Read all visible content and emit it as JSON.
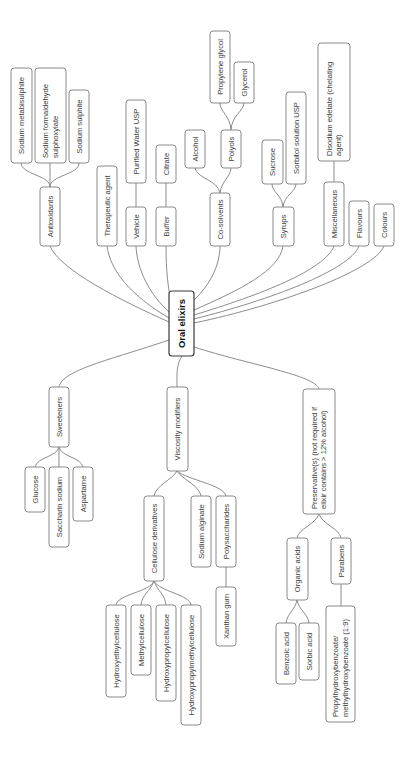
{
  "diagram": {
    "title": "Oral elixirs",
    "colors": {
      "edge": "#8c8c8c",
      "box_border": "#8a8a8a",
      "root_border": "#3a3a3a",
      "text": "#3c3c3c",
      "background": "#ffffff"
    },
    "nodes": [
      {
        "id": "root",
        "label": [
          "Oral elixirs"
        ],
        "x": 169,
        "y": 291,
        "w": 25,
        "h": 65,
        "root": true
      },
      {
        "id": "antioxidants",
        "label": [
          "Antioxidants"
        ],
        "x": 40,
        "y": 187,
        "w": 20,
        "h": 59
      },
      {
        "id": "sodium-metabisulphite",
        "label": [
          "Sodium metabisulphite"
        ],
        "x": 11,
        "y": 68,
        "w": 21,
        "h": 95
      },
      {
        "id": "sodium-formaldehyde",
        "label": [
          "Sodium formaldehyde",
          "sulphoxylate"
        ],
        "x": 35,
        "y": 68,
        "w": 31,
        "h": 95
      },
      {
        "id": "sodium-sulphite",
        "label": [
          "Sodium sulphite"
        ],
        "x": 69,
        "y": 90,
        "w": 20,
        "h": 73
      },
      {
        "id": "therapeutic-agent",
        "label": [
          "Therapeutic agent"
        ],
        "x": 97,
        "y": 166,
        "w": 20,
        "h": 80
      },
      {
        "id": "vehicle",
        "label": [
          "Vehicle"
        ],
        "x": 126,
        "y": 207,
        "w": 20,
        "h": 39
      },
      {
        "id": "purified-water",
        "label": [
          "Purified Water USP"
        ],
        "x": 126,
        "y": 100,
        "w": 20,
        "h": 83
      },
      {
        "id": "buffer",
        "label": [
          "Buffer"
        ],
        "x": 156,
        "y": 207,
        "w": 20,
        "h": 39
      },
      {
        "id": "citrate",
        "label": [
          "Citrate"
        ],
        "x": 156,
        "y": 145,
        "w": 20,
        "h": 38
      },
      {
        "id": "co-solvents",
        "label": [
          "Co-solvents"
        ],
        "x": 210,
        "y": 193,
        "w": 20,
        "h": 53
      },
      {
        "id": "alcohol",
        "label": [
          "Alcohol"
        ],
        "x": 185,
        "y": 130,
        "w": 20,
        "h": 38
      },
      {
        "id": "polyols",
        "label": [
          "Polyols"
        ],
        "x": 221,
        "y": 130,
        "w": 20,
        "h": 38
      },
      {
        "id": "propylene-glycol",
        "label": [
          "Propylene glycol"
        ],
        "x": 210,
        "y": 31,
        "w": 20,
        "h": 72
      },
      {
        "id": "glycerol",
        "label": [
          "Glycerol"
        ],
        "x": 234,
        "y": 62,
        "w": 20,
        "h": 41
      },
      {
        "id": "syrups",
        "label": [
          "Syrups"
        ],
        "x": 273,
        "y": 207,
        "w": 21,
        "h": 39
      },
      {
        "id": "sucrose",
        "label": [
          "Sucrose"
        ],
        "x": 262,
        "y": 140,
        "w": 21,
        "h": 44
      },
      {
        "id": "sorbitol",
        "label": [
          "Sorbitol solution USP"
        ],
        "x": 286,
        "y": 92,
        "w": 20,
        "h": 92
      },
      {
        "id": "miscellaneous",
        "label": [
          "Miscellaneous"
        ],
        "x": 324,
        "y": 182,
        "w": 20,
        "h": 64
      },
      {
        "id": "disodium-edetate",
        "label": [
          "Disodium edetate (chelating",
          "agent)"
        ],
        "x": 318,
        "y": 43,
        "w": 32,
        "h": 118
      },
      {
        "id": "flavours",
        "label": [
          "Flavours"
        ],
        "x": 349,
        "y": 201,
        "w": 20,
        "h": 45
      },
      {
        "id": "colours",
        "label": [
          "Colours"
        ],
        "x": 374,
        "y": 204,
        "w": 20,
        "h": 42
      },
      {
        "id": "sweeteners",
        "label": [
          "Sweeteners"
        ],
        "x": 49,
        "y": 387,
        "w": 20,
        "h": 60
      },
      {
        "id": "glucose",
        "label": [
          "Glucose"
        ],
        "x": 25,
        "y": 467,
        "w": 20,
        "h": 45
      },
      {
        "id": "saccharin-sodium",
        "label": [
          "Saccharin sodium"
        ],
        "x": 49,
        "y": 467,
        "w": 20,
        "h": 80
      },
      {
        "id": "aspartame",
        "label": [
          "Aspartame"
        ],
        "x": 73,
        "y": 467,
        "w": 20,
        "h": 54
      },
      {
        "id": "viscosity-modifiers",
        "label": [
          "Viscosity modifiers"
        ],
        "x": 167,
        "y": 387,
        "w": 21,
        "h": 84
      },
      {
        "id": "cellulose-derivatives",
        "label": [
          "Cellulose derivatives"
        ],
        "x": 144,
        "y": 496,
        "w": 20,
        "h": 85
      },
      {
        "id": "sodium-alginate",
        "label": [
          "Sodium alginate"
        ],
        "x": 191,
        "y": 496,
        "w": 20,
        "h": 71
      },
      {
        "id": "polysaccharides",
        "label": [
          "Polysaccharides"
        ],
        "x": 216,
        "y": 496,
        "w": 20,
        "h": 71
      },
      {
        "id": "xanthan-gum",
        "label": [
          "Xanthan gum"
        ],
        "x": 216,
        "y": 587,
        "w": 20,
        "h": 59
      },
      {
        "id": "hydroxyethylcellulose",
        "label": [
          "Hydroxyethylcellulose"
        ],
        "x": 106,
        "y": 605,
        "w": 20,
        "h": 92
      },
      {
        "id": "methylcellulose",
        "label": [
          "Methylcellulose"
        ],
        "x": 131,
        "y": 605,
        "w": 20,
        "h": 70
      },
      {
        "id": "hydroxypropylcellulose",
        "label": [
          "Hydroxypropylcellulose"
        ],
        "x": 156,
        "y": 605,
        "w": 20,
        "h": 96
      },
      {
        "id": "hydroxypropylmethylcellulose",
        "label": [
          "Hydroxypropylmethylcellulose"
        ],
        "x": 181,
        "y": 605,
        "w": 20,
        "h": 120
      },
      {
        "id": "preservatives",
        "label": [
          "Preservative(s) (not required if",
          "elixir contains > 12% alcohol)"
        ],
        "x": 303,
        "y": 389,
        "w": 32,
        "h": 125
      },
      {
        "id": "organic-acids",
        "label": [
          "Organic acids"
        ],
        "x": 287,
        "y": 538,
        "w": 21,
        "h": 62
      },
      {
        "id": "parabens",
        "label": [
          "Parabens"
        ],
        "x": 331,
        "y": 538,
        "w": 20,
        "h": 46
      },
      {
        "id": "benzoic-acid",
        "label": [
          "Benzoic acid"
        ],
        "x": 276,
        "y": 623,
        "w": 20,
        "h": 61
      },
      {
        "id": "sorbic-acid",
        "label": [
          "Sorbic acid"
        ],
        "x": 299,
        "y": 623,
        "w": 20,
        "h": 57
      },
      {
        "id": "propylhydroxybenzoate",
        "label": [
          "Propylhydroxybenzoate/",
          "methylhydroxybenzoate (1:9)"
        ],
        "x": 326,
        "y": 606,
        "w": 29,
        "h": 116
      }
    ],
    "edges": [
      "M169 322 C 120 300, 60 270, 50 246",
      "M169 318 C 130 295, 110 270, 107 246",
      "M170 313 C 150 295, 137 270, 136 246",
      "M172 305 C 168 290, 166 270, 166 246",
      "M194 300 C 210 285, 220 265, 220 246",
      "M194 310 C 240 290, 280 270, 283 246",
      "M194 315 C 260 295, 325 270, 334 246",
      "M194 319 C 270 300, 350 270, 359 246",
      "M194 323 C 280 305, 375 270, 384 246",
      "M50 187 C 50 175, 22 175, 21 163",
      "M50 187 L 50 163",
      "M50 187 C 50 175, 79 175, 79 163",
      "M136 207 L 136 183",
      "M166 207 L 166 183",
      "M220 193 C 218 180, 196 178, 195 168",
      "M220 193 C 222 180, 230 178, 231 168",
      "M231 130 C 230 115, 220 112, 220 103",
      "M231 130 C 232 115, 243 112, 244 103",
      "M283 207 C 282 195, 272 192, 272 184",
      "M283 207 C 284 195, 296 192, 296 184",
      "M334 182 L 334 161",
      "M169 340 C 110 360, 62 370, 59 387",
      "M182 356 C 176 365, 177 375, 177 387",
      "M194 347 C 250 365, 315 375, 319 389",
      "M59 447 C 57 457, 37 457, 35 467",
      "M59 447 L 59 467",
      "M59 447 C 61 457, 81 457, 83 467",
      "M177 471 C 172 480, 156 485, 154 496",
      "M177 471 C 183 480, 199 485, 201 496",
      "M177 471 C 188 480, 224 485, 226 496",
      "M226 567 L 226 587",
      "M154 581 C 150 592, 118 594, 116 605",
      "M154 581 C 150 592, 142 594, 141 605",
      "M154 581 C 158 592, 165 594, 166 605",
      "M154 581 C 160 592, 189 594, 191 605",
      "M319 514 C 315 525, 299 528, 297 538",
      "M319 514 C 323 525, 339 528, 341 538",
      "M297 600 C 295 610, 287 614, 286 623",
      "M297 600 C 299 610, 308 614, 309 623",
      "M341 584 L 341 606"
    ]
  }
}
